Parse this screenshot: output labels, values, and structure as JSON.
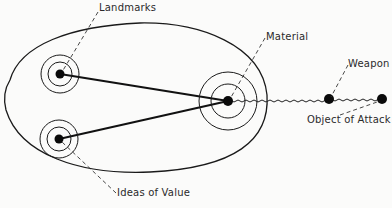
{
  "diagram": {
    "labels": {
      "landmarks": "Landmarks",
      "material": "Material",
      "weapon": "Weapon",
      "object_of_attack": "Object of Attack",
      "ideas_of_value": "Ideas of Value"
    },
    "nodes": [
      {
        "id": "landmarks",
        "label": "Landmarks",
        "x": 60,
        "y": 74,
        "rings": [
          12,
          19
        ]
      },
      {
        "id": "ideas_of_value",
        "label": "Ideas of Value",
        "x": 59,
        "y": 139,
        "rings": [
          12,
          19
        ]
      },
      {
        "id": "material",
        "label": "Material",
        "x": 228,
        "y": 101,
        "rings": [
          17,
          29
        ]
      },
      {
        "id": "weapon",
        "label": "Weapon",
        "x": 329,
        "y": 99,
        "rings": []
      },
      {
        "id": "object_of_attack",
        "label": "Object of Attack",
        "x": 382,
        "y": 99,
        "rings": []
      }
    ],
    "edges": [
      {
        "from": "landmarks",
        "to": "material",
        "style": "solid"
      },
      {
        "from": "ideas_of_value",
        "to": "material",
        "style": "solid"
      },
      {
        "from": "material",
        "to": "weapon",
        "style": "wavy"
      },
      {
        "from": "weapon",
        "to": "object_of_attack",
        "style": "wavy"
      }
    ],
    "enclosure": {
      "shape": "ellipse",
      "contains": [
        "landmarks",
        "ideas_of_value",
        "material"
      ]
    },
    "colors": {
      "ink": "#1a1a1a",
      "background": "#fbfbfa"
    }
  }
}
